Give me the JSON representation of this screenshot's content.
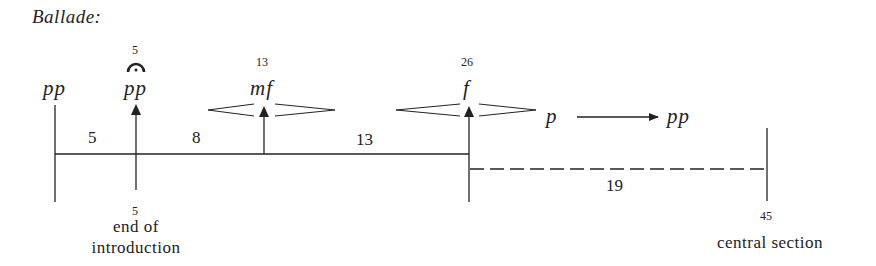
{
  "title": "Ballade:",
  "markers": [
    {
      "id": "start",
      "dynamic": "pp"
    },
    {
      "id": "intro-end",
      "bar_above": "5",
      "fermata": true,
      "dynamic": "pp",
      "bar_below": "5",
      "label_line1": "end of",
      "label_line2": "introduction"
    },
    {
      "id": "mf",
      "bar_above": "13",
      "dynamic": "mf"
    },
    {
      "id": "f",
      "bar_above": "26",
      "dynamic": "f"
    },
    {
      "id": "central",
      "bar_below": "45",
      "label": "central section"
    }
  ],
  "segments": [
    "5",
    "8",
    "13"
  ],
  "dashed_segment": "19",
  "decay": {
    "from": "p",
    "to": "pp"
  },
  "colors": {
    "ink": "#222222",
    "background": "#ffffff"
  }
}
